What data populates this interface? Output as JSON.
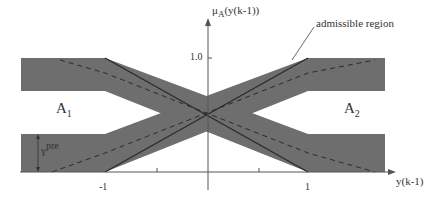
{
  "diagram": {
    "y_axis_label_main": "μ",
    "y_axis_label_sub": "A",
    "y_axis_label_arg": "(y(k-1))",
    "x_axis_label": "y(k-1)",
    "tick_y_top": "1.0",
    "tick_x_neg": "-1",
    "tick_x_pos": "1",
    "set_a1_main": "A",
    "set_a1_sub": "1",
    "set_a2_main": "A",
    "set_a2_sub": "2",
    "gamma_main": "γ",
    "gamma_sup": "pre",
    "annotation": "admissible region",
    "colors": {
      "band_fill": "#6e6e6e",
      "line": "#2a2a2a",
      "axis": "#555555",
      "background": "#ffffff"
    }
  }
}
